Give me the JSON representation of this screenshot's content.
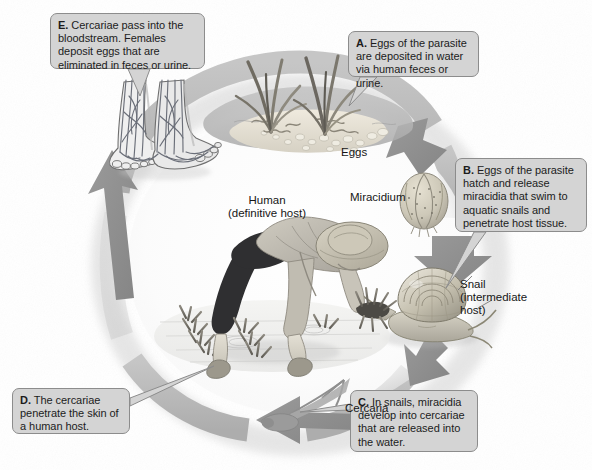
{
  "figure": {
    "background_color": "#fdfdfc",
    "ring_color": "#b9b9b9",
    "arrow_color": "#8d8d8d",
    "callout_fill": "#d4d4d4",
    "callout_border": "#8c8c8c"
  },
  "callouts": [
    {
      "id": "A",
      "letter": "A.",
      "text": "Eggs of the parasite are deposited in water via human feces or urine.",
      "points_to": "eggs-in-water"
    },
    {
      "id": "B",
      "letter": "B.",
      "text": "Eggs of the parasite hatch and release miracidia that swim to aquatic snails and penetrate host tissue.",
      "points_to": "snail"
    },
    {
      "id": "C",
      "letter": "C.",
      "text": "In snails, miracidia develop into cercariae that are released into the water.",
      "points_to": "cercaria"
    },
    {
      "id": "D",
      "letter": "D.",
      "text": "The cercariae penetrate the skin of a human host.",
      "points_to": "human-legs"
    },
    {
      "id": "E",
      "letter": "E.",
      "text": "Cercariae pass into the bloodstream. Females deposit eggs that are eliminated in feces or urine.",
      "points_to": "feet-vessels"
    }
  ],
  "labels": {
    "eggs": "Eggs",
    "miracidium": "Miracidium",
    "snail_line1": "Snail",
    "snail_line2": "(intermediate",
    "snail_line3": "host)",
    "cercaria": "Cercaria",
    "human_line1": "Human",
    "human_line2": "(definitive host)"
  },
  "stages": [
    {
      "name": "eggs",
      "label": "Eggs",
      "host": "water"
    },
    {
      "name": "miracidium",
      "label": "Miracidium",
      "host": "water"
    },
    {
      "name": "snail",
      "label": "Snail (intermediate host)",
      "host": "snail"
    },
    {
      "name": "cercaria",
      "label": "Cercaria",
      "host": "water"
    },
    {
      "name": "human",
      "label": "Human (definitive host)",
      "host": "human"
    }
  ]
}
